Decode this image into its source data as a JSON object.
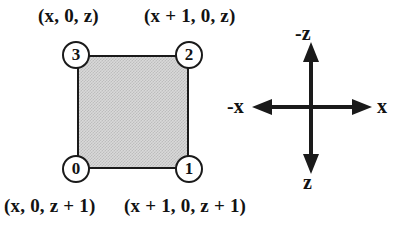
{
  "figure": {
    "type": "diagram",
    "fill_color": "#d9d9d9",
    "line_color": "#1a1a1a"
  },
  "quad": {
    "vertices": [
      {
        "id": "0",
        "number": "0",
        "position": "bottom-left",
        "coordinate": "(x, 0, z + 1)"
      },
      {
        "id": "1",
        "number": "1",
        "position": "bottom-right",
        "coordinate": "(x + 1, 0, z + 1)"
      },
      {
        "id": "2",
        "number": "2",
        "position": "top-right",
        "coordinate": "(x + 1, 0, z)"
      },
      {
        "id": "3",
        "number": "3",
        "position": "top-left",
        "coordinate": "(x, 0, z)"
      }
    ],
    "labels": {
      "top_left": "(x, 0, z)",
      "top_right": "(x + 1, 0, z)",
      "bottom_left": "(x, 0, z + 1)",
      "bottom_right": "(x + 1, 0, z + 1)"
    }
  },
  "axes": {
    "up": "-z",
    "down": "z",
    "right": "x",
    "left": "-x"
  }
}
